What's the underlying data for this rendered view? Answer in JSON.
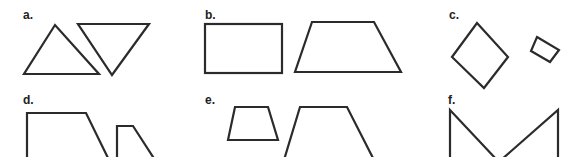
{
  "panels": [
    {
      "id": "a",
      "label": "a.",
      "shapes": [
        "upright-triangle",
        "inverted-triangle"
      ]
    },
    {
      "id": "b",
      "label": "b.",
      "shapes": [
        "rectangle",
        "trapezoid"
      ]
    },
    {
      "id": "c",
      "label": "c.",
      "shapes": [
        "large-rotated-square",
        "small-rotated-square"
      ]
    },
    {
      "id": "d",
      "label": "d.",
      "shapes": [
        "large-right-trapezoid",
        "small-right-trapezoid"
      ]
    },
    {
      "id": "e",
      "label": "e.",
      "shapes": [
        "small-isosceles-trapezoid",
        "large-isosceles-trapezoid"
      ]
    },
    {
      "id": "f",
      "label": "f.",
      "shapes": [
        "right-triangle-left",
        "right-triangle-right"
      ]
    }
  ],
  "colors": {
    "stroke": "#2b2b2b",
    "label": "#222222",
    "background": "#ffffff"
  }
}
